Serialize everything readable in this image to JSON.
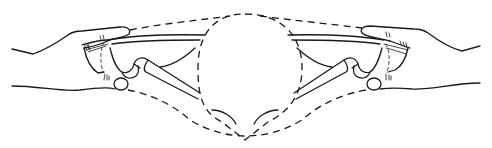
{
  "figure": {
    "type": "line-art illustration",
    "stroke_color": "#1a1a1a",
    "background_color": "#ffffff",
    "elements": {
      "left_hand": "left-hand",
      "right_hand": "right-hand",
      "fetal_head_outline": "dashed-circle",
      "pelvis_outline": "dashed-pelvis",
      "left_bone": "left-pubic-bone",
      "right_bone": "right-pubic-bone"
    }
  }
}
